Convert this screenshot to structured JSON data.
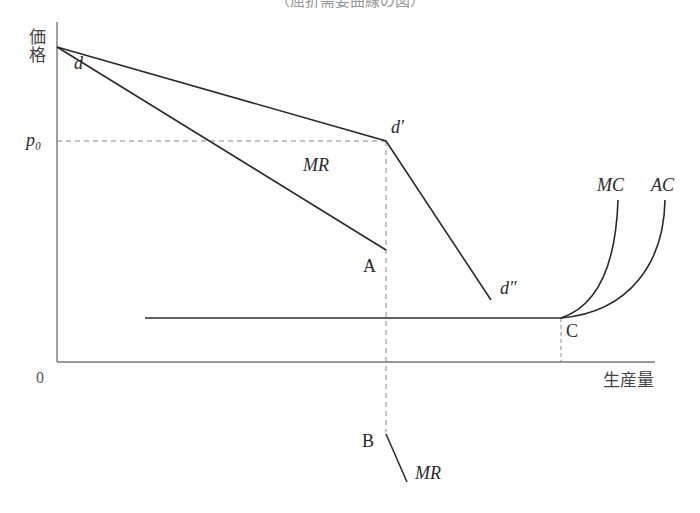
{
  "figure": {
    "title_partial": "（屈折需要曲線の図）",
    "axes": {
      "y_label": "価格",
      "x_label": "生産量",
      "origin": "0",
      "price_level": "p₀"
    },
    "curves": {
      "demand_start": "d",
      "kink": "d′",
      "demand_end": "d″",
      "mr_upper": "MR",
      "mr_lower": "MR",
      "mc": "MC",
      "ac": "AC"
    },
    "points": {
      "A": "A",
      "B": "B",
      "C": "C"
    },
    "colors": {
      "line": "#2a2a2a",
      "axis": "#777777",
      "dashed": "#888888"
    }
  }
}
